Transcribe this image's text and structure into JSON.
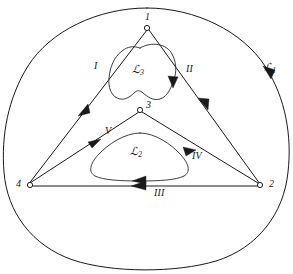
{
  "figure": {
    "kind": "contour-diagram",
    "background_color": "#ffffff",
    "line_color": "#1a1a1a",
    "width": 293,
    "height": 274
  },
  "vertices": [
    {
      "id": "v1",
      "label": "1",
      "x": 148,
      "y": 25
    },
    {
      "id": "v2",
      "label": "2",
      "x": 262,
      "y": 185
    },
    {
      "id": "v3",
      "label": "3",
      "x": 140,
      "y": 108
    },
    {
      "id": "v4",
      "label": "4",
      "x": 28,
      "y": 185
    }
  ],
  "edge_labels": [
    {
      "id": "edge-I",
      "label": "I",
      "x": 96,
      "y": 66
    },
    {
      "id": "edge-II",
      "label": "II",
      "x": 188,
      "y": 70
    },
    {
      "id": "edge-III",
      "label": "III",
      "x": 158,
      "y": 190
    },
    {
      "id": "edge-IV",
      "label": "IV",
      "x": 196,
      "y": 156
    },
    {
      "id": "edge-V",
      "label": "V",
      "x": 107,
      "y": 131
    }
  ],
  "contour_labels": [
    {
      "id": "contour-1",
      "symbol": "ℒ",
      "subscript": "1",
      "x": 268,
      "y": 68
    },
    {
      "id": "contour-2",
      "symbol": "ℒ",
      "subscript": "2",
      "x": 135,
      "y": 152
    },
    {
      "id": "contour-3",
      "symbol": "ℒ",
      "subscript": "3",
      "x": 137,
      "y": 70
    }
  ],
  "curves": {
    "outer_boundary": "closed rounded-triangular outer contour",
    "outer_triangle": "triangle through vertices 1, 2, 4",
    "inner_triangle": "triangle through vertices 3, 2, 4",
    "blob_upper": "kidney-shaped closed contour inside upper triangle",
    "blob_lower": "rounded-triangular closed contour inside lower triangle"
  },
  "arrows": [
    {
      "id": "arrow-outer-right",
      "on": "outer_boundary",
      "direction": "clockwise-down"
    },
    {
      "id": "arrow-edge-I",
      "on": "edge-I",
      "direction": "up-right"
    },
    {
      "id": "arrow-edge-II",
      "on": "edge-II",
      "direction": "down-right"
    },
    {
      "id": "arrow-edge-III",
      "on": "edge-III",
      "direction": "left"
    },
    {
      "id": "arrow-edge-IV",
      "on": "edge-IV",
      "direction": "up-right"
    },
    {
      "id": "arrow-edge-V",
      "on": "edge-V",
      "direction": "down-left"
    },
    {
      "id": "arrow-blob-3",
      "on": "blob_upper",
      "direction": "down"
    },
    {
      "id": "arrow-blob-2",
      "on": "blob_lower",
      "direction": "left"
    }
  ]
}
